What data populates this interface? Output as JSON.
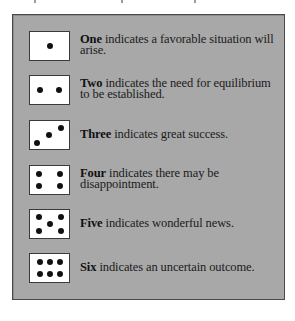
{
  "panel": {
    "background": "#a8a8a8",
    "border": "#4a4a4a",
    "die_face_color": "#ffffff",
    "pip_color": "#111111"
  },
  "rows": [
    {
      "number_word": "One",
      "description": " indicates a favorable situation will arise.",
      "pips": 1,
      "die_icon": "die-face-one-icon"
    },
    {
      "number_word": "Two",
      "description": " indicates the need for equilibrium to be established.",
      "pips": 2,
      "die_icon": "die-face-two-icon"
    },
    {
      "number_word": "Three",
      "description": " indicates great success.",
      "pips": 3,
      "die_icon": "die-face-three-icon"
    },
    {
      "number_word": "Four",
      "description": " indicates there may be disappointment.",
      "pips": 4,
      "die_icon": "die-face-four-icon"
    },
    {
      "number_word": "Five",
      "description": " indicates wonderful news.",
      "pips": 5,
      "die_icon": "die-face-five-icon"
    },
    {
      "number_word": "Six",
      "description": " indicates an uncertain outcome.",
      "pips": 6,
      "die_icon": "die-face-six-icon"
    }
  ]
}
